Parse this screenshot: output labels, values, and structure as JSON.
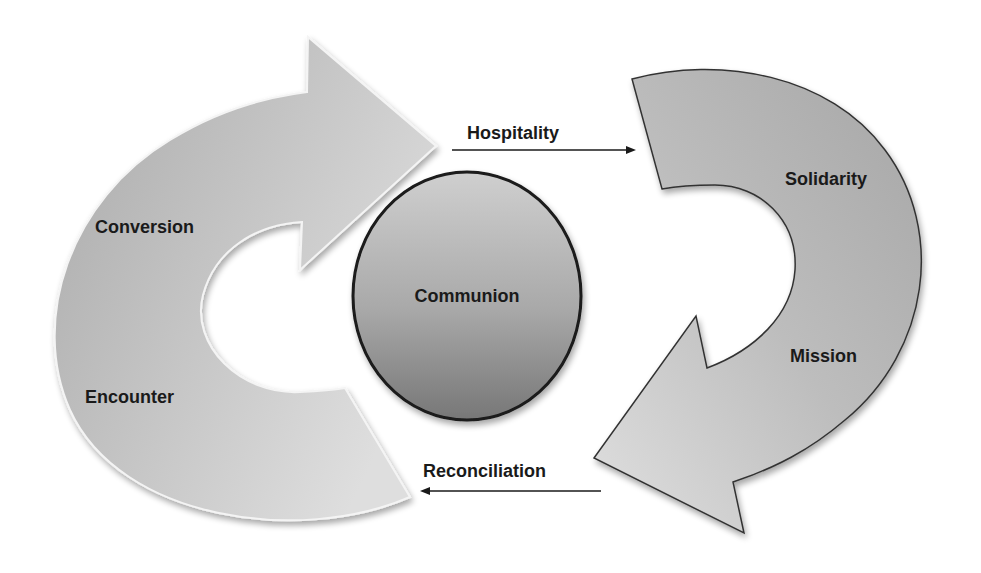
{
  "diagram": {
    "type": "cycle",
    "center": {
      "label": "Communion"
    },
    "left_cycle": {
      "direction": "clockwise",
      "labels": [
        "Conversion",
        "Encounter"
      ]
    },
    "right_cycle": {
      "direction": "clockwise",
      "labels": [
        "Solidarity",
        "Mission"
      ]
    },
    "connectors": [
      {
        "label": "Hospitality",
        "direction": "right"
      },
      {
        "label": "Reconciliation",
        "direction": "left"
      }
    ],
    "colors": {
      "arrow_light": "#d6d6d6",
      "arrow_dark": "#a8a8a8",
      "ellipse_light": "#c4c4c4",
      "ellipse_dark": "#7a7a7a",
      "outline": "#1a1a1a",
      "text": "#1a1a1a"
    }
  }
}
